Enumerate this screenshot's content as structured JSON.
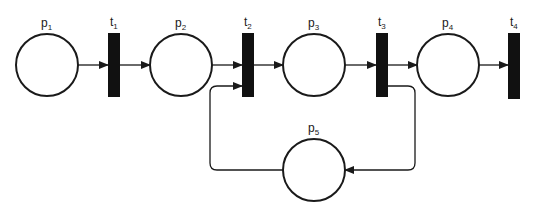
{
  "diagram": {
    "type": "petri-net",
    "colors": {
      "stroke": "#1a1a1a",
      "transition_fill": "#111111",
      "background": "#ffffff"
    },
    "places": [
      {
        "id": "p1",
        "base": "p",
        "sub": "1",
        "cx": 47,
        "cy": 65,
        "r": 31
      },
      {
        "id": "p2",
        "base": "p",
        "sub": "2",
        "cx": 181,
        "cy": 65,
        "r": 31
      },
      {
        "id": "p3",
        "base": "p",
        "sub": "3",
        "cx": 314,
        "cy": 65,
        "r": 31
      },
      {
        "id": "p4",
        "base": "p",
        "sub": "4",
        "cx": 448,
        "cy": 65,
        "r": 31
      },
      {
        "id": "p5",
        "base": "p",
        "sub": "5",
        "cx": 314,
        "cy": 170,
        "r": 31
      }
    ],
    "transitions": [
      {
        "id": "t1",
        "base": "t",
        "sub": "1",
        "x": 108,
        "y": 33,
        "w": 12,
        "h": 64
      },
      {
        "id": "t2",
        "base": "t",
        "sub": "2",
        "x": 242,
        "y": 33,
        "w": 12,
        "h": 64
      },
      {
        "id": "t3",
        "base": "t",
        "sub": "3",
        "x": 376,
        "y": 33,
        "w": 12,
        "h": 64
      },
      {
        "id": "t4",
        "base": "t",
        "sub": "4",
        "x": 508,
        "y": 33,
        "w": 12,
        "h": 66
      }
    ],
    "arcs": [
      {
        "from": "p1",
        "to": "t1"
      },
      {
        "from": "t1",
        "to": "p2"
      },
      {
        "from": "p2",
        "to": "t2"
      },
      {
        "from": "t2",
        "to": "p3"
      },
      {
        "from": "p3",
        "to": "t3"
      },
      {
        "from": "t3",
        "to": "p4"
      },
      {
        "from": "p4",
        "to": "t4"
      },
      {
        "from": "t3",
        "to": "p5"
      },
      {
        "from": "p5",
        "to": "t2"
      }
    ]
  }
}
